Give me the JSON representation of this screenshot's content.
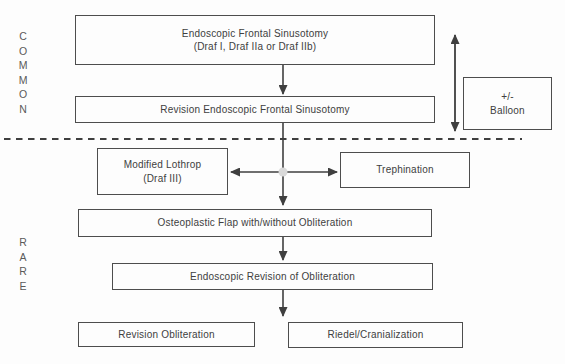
{
  "diagram": {
    "region_labels": {
      "common": "COMMON",
      "rare": "RARE"
    },
    "boxes": {
      "endoscopic_frontal_sinusotomy": {
        "line1": "Endoscopic Frontal Sinusotomy",
        "line2": "(Draf I, Draf IIa or Draf IIb)"
      },
      "revision_endoscopic_frontal_sinusotomy": {
        "label": "Revision Endoscopic Frontal Sinusotomy"
      },
      "balloon_annotation": {
        "line1": "+/-",
        "line2": "Balloon"
      },
      "modified_lothrop": {
        "line1": "Modified Lothrop",
        "line2": "(Draf III)"
      },
      "trephination": {
        "label": "Trephination"
      },
      "osteoplastic_flap": {
        "label": "Osteoplastic Flap with/without Obliteration"
      },
      "endoscopic_revision_of_obliteration": {
        "label": "Endoscopic Revision of Obliteration"
      },
      "revision_obliteration": {
        "label": "Revision Obliteration"
      },
      "riedel_cranialization": {
        "label": "Riedel/Cranialization"
      }
    },
    "colors": {
      "line": "#3f3f3f",
      "box_border": "#4d4d4d",
      "text": "#404040",
      "region_label": "#5a5a5a",
      "junction_dot": "#d9d9d9",
      "background": "#fdfdfd"
    }
  }
}
